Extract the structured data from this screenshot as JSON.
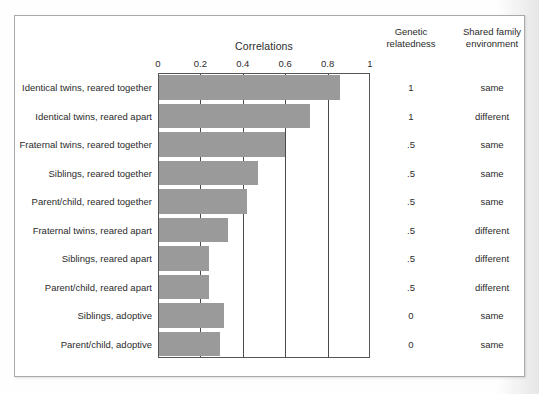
{
  "chart_data": {
    "type": "bar",
    "title": "Correlations",
    "orientation": "horizontal",
    "xlabel": "Correlations",
    "ylabel": "",
    "xlim": [
      0,
      1
    ],
    "xticks": [
      "0",
      "0.2",
      "0.4",
      "0.6",
      "0.8",
      "1"
    ],
    "xtick_values": [
      0,
      0.2,
      0.4,
      0.6,
      0.8,
      1
    ],
    "grid": "vertical gridlines at 0.2, 0.4, 0.6, 0.8",
    "legend": "none",
    "categories": [
      "Identical twins, reared together",
      "Identical twins, reared apart",
      "Fraternal twins, reared together",
      "Siblings, reared together",
      "Parent/child, reared together",
      "Fraternal twins, reared apart",
      "Siblings, reared apart",
      "Parent/child, reared apart",
      "Siblings, adoptive",
      "Parent/child, adoptive"
    ],
    "values": [
      0.86,
      0.72,
      0.6,
      0.47,
      0.42,
      0.33,
      0.24,
      0.24,
      0.31,
      0.29
    ],
    "bar_color": "#9a9a9a",
    "columns": [
      {
        "header": "Genetic\nrelatedness",
        "key": "genetic_relatedness"
      },
      {
        "header": "Shared family\nenvironment",
        "key": "shared_family_environment"
      }
    ],
    "genetic_relatedness": [
      "1",
      "1",
      ".5",
      ".5",
      ".5",
      ".5",
      ".5",
      ".5",
      "0",
      "0"
    ],
    "shared_family_environment": [
      "same",
      "different",
      "same",
      "same",
      "same",
      "different",
      "different",
      "different",
      "same",
      "same"
    ]
  },
  "headers": {
    "chart_title": "Correlations",
    "genetic_line1": "Genetic",
    "genetic_line2": "relatedness",
    "shared_line1": "Shared family",
    "shared_line2": "environment"
  },
  "rows": [
    {
      "label": "Identical twins, reared together",
      "value": 0.86,
      "genetic": "1",
      "shared": "same"
    },
    {
      "label": "Identical twins, reared apart",
      "value": 0.72,
      "genetic": "1",
      "shared": "different"
    },
    {
      "label": "Fraternal twins, reared together",
      "value": 0.6,
      "genetic": ".5",
      "shared": "same"
    },
    {
      "label": "Siblings, reared together",
      "value": 0.47,
      "genetic": ".5",
      "shared": "same"
    },
    {
      "label": "Parent/child, reared together",
      "value": 0.42,
      "genetic": ".5",
      "shared": "same"
    },
    {
      "label": "Fraternal twins, reared apart",
      "value": 0.33,
      "genetic": ".5",
      "shared": "different"
    },
    {
      "label": "Siblings, reared apart",
      "value": 0.24,
      "genetic": ".5",
      "shared": "different"
    },
    {
      "label": "Parent/child, reared apart",
      "value": 0.24,
      "genetic": ".5",
      "shared": "different"
    },
    {
      "label": "Siblings, adoptive",
      "value": 0.31,
      "genetic": "0",
      "shared": "same"
    },
    {
      "label": "Parent/child, adoptive",
      "value": 0.29,
      "genetic": "0",
      "shared": "same"
    }
  ],
  "axis": {
    "ticks": [
      "0",
      "0.2",
      "0.4",
      "0.6",
      "0.8",
      "1"
    ],
    "tick_values": [
      0,
      0.2,
      0.4,
      0.6,
      0.8,
      1
    ]
  },
  "colors": {
    "bar": "#9a9a9a",
    "frame": "#a9a9a9",
    "plot_border": "#555555",
    "gridline": "#4a4a4a",
    "text": "#2b2b2b"
  }
}
